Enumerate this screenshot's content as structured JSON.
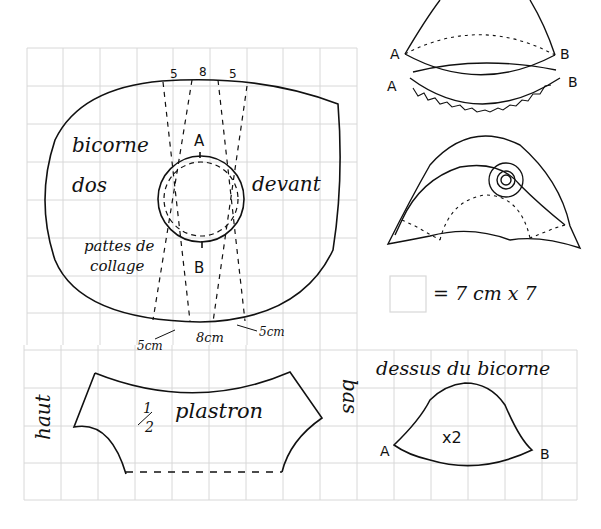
{
  "diagram": {
    "colors": {
      "grid": "#d8d8d8",
      "ink": "#111111",
      "background": "#ffffff"
    },
    "scale_note": "= 7 cm x 7",
    "brim_piece": {
      "labels": {
        "name": "bicorne",
        "back": "dos",
        "front": "devant",
        "tabs_line1": "pattes de",
        "tabs_line2": "collage",
        "point_a": "A",
        "point_b": "B"
      },
      "top_measures": [
        "5",
        "8",
        "5"
      ],
      "bottom_measures": {
        "left": "5cm",
        "center": "8cm",
        "right": "5cm"
      }
    },
    "assembly_top": {
      "left_upper": "A",
      "right_upper": "B",
      "left_lower": "A",
      "right_lower": "B"
    },
    "plastron": {
      "fraction": "1/2",
      "fraction_num": "1",
      "fraction_den": "2",
      "name": "plastron",
      "left_label": "haut",
      "right_label": "bas"
    },
    "crown_piece": {
      "title": "dessus du bicorne",
      "count": "x2",
      "point_a": "A",
      "point_b": "B"
    }
  }
}
